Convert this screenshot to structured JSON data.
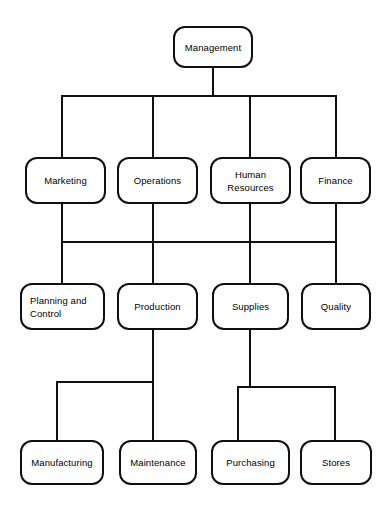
{
  "diagram": {
    "type": "organization-chart",
    "style": {
      "box_fill": "#ffffff",
      "box_stroke": "#101010",
      "line_color": "#101010",
      "text_color": "#000000",
      "background": "#ffffff",
      "corner_radius": 12,
      "stroke_width": 2
    },
    "levels": [
      {
        "level": 1,
        "nodes": [
          {
            "id": "management",
            "label": "Management",
            "x": 173,
            "y": 26,
            "w": 80,
            "h": 42,
            "align": "center"
          }
        ]
      },
      {
        "level": 2,
        "nodes": [
          {
            "id": "marketing",
            "label": "Marketing",
            "x": 25,
            "y": 157,
            "w": 81,
            "h": 47,
            "align": "center"
          },
          {
            "id": "operations",
            "label": "Operations",
            "x": 117,
            "y": 157,
            "w": 81,
            "h": 47,
            "align": "center"
          },
          {
            "id": "human-resources",
            "label": "Human\nResources",
            "x": 210,
            "y": 157,
            "w": 81,
            "h": 47,
            "align": "center"
          },
          {
            "id": "finance",
            "label": "Finance",
            "x": 300,
            "y": 157,
            "w": 71,
            "h": 47,
            "align": "center"
          }
        ]
      },
      {
        "level": 3,
        "nodes": [
          {
            "id": "planning-and-control",
            "label": "Planning and\nControl",
            "x": 20,
            "y": 283,
            "w": 85,
            "h": 47,
            "align": "left"
          },
          {
            "id": "production",
            "label": "Production",
            "x": 117,
            "y": 283,
            "w": 81,
            "h": 47,
            "align": "center"
          },
          {
            "id": "supplies",
            "label": "Supplies",
            "x": 212,
            "y": 283,
            "w": 77,
            "h": 47,
            "align": "center"
          },
          {
            "id": "quality",
            "label": "Quality",
            "x": 301,
            "y": 283,
            "w": 70,
            "h": 47,
            "align": "center"
          }
        ]
      },
      {
        "level": 4,
        "nodes": [
          {
            "id": "manufacturing",
            "label": "Manufacturing",
            "x": 20,
            "y": 440,
            "w": 84,
            "h": 45,
            "align": "center"
          },
          {
            "id": "maintenance",
            "label": "Maintenance",
            "x": 119,
            "y": 440,
            "w": 78,
            "h": 45,
            "align": "center"
          },
          {
            "id": "purchasing",
            "label": "Purchasing",
            "x": 211,
            "y": 440,
            "w": 79,
            "h": 45,
            "align": "center"
          },
          {
            "id": "stores",
            "label": "Stores",
            "x": 300,
            "y": 440,
            "w": 72,
            "h": 45,
            "align": "center"
          }
        ]
      }
    ],
    "connectors": {
      "description": "Orthogonal bus-style connector lines joining parent nodes to child nodes",
      "segments": [
        {
          "id": "management-stem",
          "kind": "vertical",
          "x": 213,
          "y1": 68,
          "y2": 96
        },
        {
          "id": "level2-bus",
          "kind": "horizontal",
          "y": 96,
          "x1": 62,
          "x2": 336
        },
        {
          "id": "drop-marketing",
          "kind": "vertical",
          "x": 62,
          "y1": 96,
          "y2": 158
        },
        {
          "id": "drop-operations",
          "kind": "vertical",
          "x": 153,
          "y1": 96,
          "y2": 158
        },
        {
          "id": "drop-human-resources",
          "kind": "vertical",
          "x": 250,
          "y1": 96,
          "y2": 158
        },
        {
          "id": "drop-finance",
          "kind": "vertical",
          "x": 336,
          "y1": 96,
          "y2": 158
        },
        {
          "id": "stem-marketing",
          "kind": "vertical",
          "x": 62,
          "y1": 204,
          "y2": 242
        },
        {
          "id": "stem-operations",
          "kind": "vertical",
          "x": 153,
          "y1": 204,
          "y2": 242
        },
        {
          "id": "stem-human-resources",
          "kind": "vertical",
          "x": 250,
          "y1": 204,
          "y2": 242
        },
        {
          "id": "stem-finance",
          "kind": "vertical",
          "x": 336,
          "y1": 204,
          "y2": 242
        },
        {
          "id": "level3-bus",
          "kind": "horizontal",
          "y": 242,
          "x1": 62,
          "x2": 336
        },
        {
          "id": "drop-planning",
          "kind": "vertical",
          "x": 62,
          "y1": 242,
          "y2": 284
        },
        {
          "id": "drop-production",
          "kind": "vertical",
          "x": 153,
          "y1": 242,
          "y2": 284
        },
        {
          "id": "drop-supplies",
          "kind": "vertical",
          "x": 250,
          "y1": 242,
          "y2": 284
        },
        {
          "id": "drop-quality",
          "kind": "vertical",
          "x": 336,
          "y1": 242,
          "y2": 284
        },
        {
          "id": "stem-production",
          "kind": "vertical",
          "x": 153,
          "y1": 330,
          "y2": 382
        },
        {
          "id": "level4-bus-left",
          "kind": "horizontal",
          "y": 382,
          "x1": 57,
          "x2": 153
        },
        {
          "id": "drop-manufacturing",
          "kind": "vertical",
          "x": 57,
          "y1": 382,
          "y2": 441
        },
        {
          "id": "drop-maintenance",
          "kind": "vertical",
          "x": 153,
          "y1": 382,
          "y2": 441
        },
        {
          "id": "stem-supplies",
          "kind": "vertical",
          "x": 250,
          "y1": 330,
          "y2": 387
        },
        {
          "id": "level4-bus-right",
          "kind": "horizontal",
          "y": 387,
          "x1": 238,
          "x2": 335
        },
        {
          "id": "drop-purchasing",
          "kind": "vertical",
          "x": 238,
          "y1": 387,
          "y2": 441
        },
        {
          "id": "drop-stores",
          "kind": "vertical",
          "x": 335,
          "y1": 387,
          "y2": 441
        }
      ]
    }
  }
}
